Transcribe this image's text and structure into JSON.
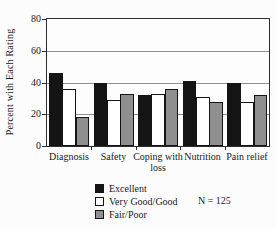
{
  "figure": {
    "background": "#fcfcfc",
    "axis_color": "#2e2e2e",
    "gridline_color": "#8f8f8f"
  },
  "chart_data": {
    "type": "bar",
    "title": "",
    "xlabel": "",
    "ylabel": "Percent with Each Rating",
    "ylim": [
      0,
      80
    ],
    "yticks": [
      0,
      20,
      40,
      60,
      80
    ],
    "grid": true,
    "legend_position": "bottom-left",
    "note": "N = 125",
    "categories": [
      "Diagnosis",
      "Safety",
      "Coping with loss",
      "Nutrition",
      "Pain relief"
    ],
    "series": [
      {
        "name": "Excellent",
        "color": "#141414",
        "values": [
          46,
          40,
          32,
          41,
          40
        ]
      },
      {
        "name": "Very Good/Good",
        "color": "#ffffff",
        "values": [
          36,
          29,
          33,
          31,
          28
        ]
      },
      {
        "name": "Fair/Poor",
        "color": "#8f8f8f",
        "values": [
          18,
          33,
          36,
          28,
          32
        ]
      }
    ]
  }
}
